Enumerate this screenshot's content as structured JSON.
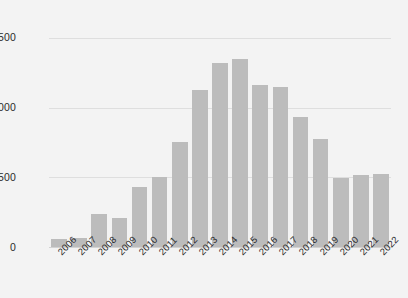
{
  "chart_data": {
    "type": "bar",
    "title": "",
    "subtitle": "",
    "xlabel": "",
    "ylabel": "",
    "categories": [
      "2006",
      "2007",
      "2008",
      "2009",
      "2010",
      "2011",
      "2012",
      "2013",
      "2014",
      "2015",
      "2016",
      "2017",
      "2018",
      "2019",
      "2020",
      "2021",
      "2022"
    ],
    "values": [
      60,
      62,
      235,
      210,
      430,
      505,
      755,
      1125,
      1320,
      1350,
      1165,
      1145,
      935,
      775,
      495,
      520,
      525
    ],
    "series": [
      {
        "name": "",
        "values": [
          60,
          62,
          235,
          210,
          430,
          505,
          755,
          1125,
          1320,
          1350,
          1165,
          1145,
          935,
          775,
          495,
          520,
          525
        ]
      }
    ],
    "ylim": [
      0,
      1600
    ],
    "yticks": [
      0,
      500,
      1000,
      1500
    ],
    "ytick_labels": [
      "0",
      "500",
      "1,000",
      "1,500"
    ],
    "grid": "horizontal",
    "legend": "none",
    "bar_color": "#bcbcbc",
    "gridline_color": "#dedede",
    "background_color": "#f3f3f3",
    "text_color": "#2b2b2b",
    "xtick_rotation": -45
  }
}
